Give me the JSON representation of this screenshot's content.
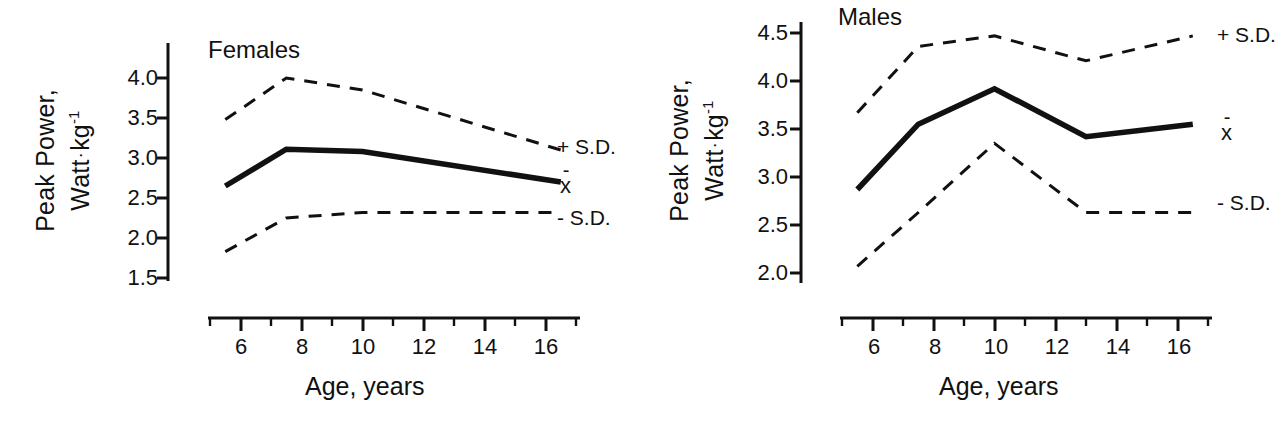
{
  "figure": {
    "width": 1282,
    "height": 423,
    "background": "#ffffff",
    "ink_color": "#111111"
  },
  "axis_titles": {
    "y_line1": "Peak Power,",
    "y_line2_main": "Watt",
    "y_line2_dot": "·",
    "y_line2_unit": "kg",
    "y_line2_exponent": "-1",
    "x": "Age,  years"
  },
  "panels": [
    {
      "id": "females",
      "title": "Females",
      "y_ticks": [
        "4.0",
        "3.5",
        "3.0",
        "2.5",
        "2.0",
        "1.5"
      ],
      "x_ticks": [
        "6",
        "8",
        "10",
        "12",
        "14",
        "16"
      ],
      "series_labels": {
        "upper": "+ S.D.",
        "mean": "x",
        "mean_overbar": "-",
        "lower": "- S.D."
      }
    },
    {
      "id": "males",
      "title": "Males",
      "y_ticks": [
        "4.5",
        "4.0",
        "3.5",
        "3.0",
        "2.5",
        "2.0"
      ],
      "x_ticks": [
        "6",
        "8",
        "10",
        "12",
        "14",
        "16"
      ],
      "series_labels": {
        "upper": "+ S.D.",
        "mean": "x",
        "mean_overbar": "-",
        "lower": "- S.D."
      }
    }
  ],
  "chart_data": [
    {
      "type": "line",
      "title": "Females",
      "xlabel": "Age, years",
      "ylabel": "Peak Power, Watt · kg^-1",
      "xlim": [
        5.0,
        17.0
      ],
      "ylim": [
        1.5,
        4.15
      ],
      "grid": false,
      "legend_position": "right-of-curves",
      "x_major_ticks": [
        6,
        8,
        10,
        12,
        14,
        16
      ],
      "x_minor_ticks": [
        5,
        7,
        9,
        11,
        13,
        15,
        17
      ],
      "y_ticks": [
        1.5,
        2.0,
        2.5,
        3.0,
        3.5,
        4.0
      ],
      "x": [
        5.5,
        7.5,
        10.0,
        16.5
      ],
      "series": [
        {
          "name": "+ S.D.",
          "style": "dashed",
          "values": [
            3.48,
            4.0,
            3.85,
            3.1
          ]
        },
        {
          "name": "x̄",
          "style": "solid",
          "values": [
            2.65,
            3.11,
            3.08,
            2.7
          ]
        },
        {
          "name": "- S.D.",
          "style": "dashed",
          "values": [
            1.83,
            2.25,
            2.32,
            2.32
          ]
        }
      ]
    },
    {
      "type": "line",
      "title": "Males",
      "xlabel": "Age, years",
      "ylabel": "Peak Power, Watt · kg^-1",
      "xlim": [
        5.0,
        17.0
      ],
      "ylim": [
        2.0,
        4.6
      ],
      "grid": false,
      "legend_position": "right-of-curves",
      "x_major_ticks": [
        6,
        8,
        10,
        12,
        14,
        16
      ],
      "x_minor_ticks": [
        5,
        7,
        9,
        11,
        13,
        15,
        17
      ],
      "y_ticks": [
        2.0,
        2.5,
        3.0,
        3.5,
        4.0,
        4.5
      ],
      "x": [
        5.5,
        7.5,
        10.0,
        13.0,
        16.5
      ],
      "series": [
        {
          "name": "+ S.D.",
          "style": "dashed",
          "values": [
            3.67,
            4.36,
            4.47,
            4.21,
            4.47
          ]
        },
        {
          "name": "x̄",
          "style": "solid",
          "values": [
            2.87,
            3.55,
            3.92,
            3.42,
            3.55
          ]
        },
        {
          "name": "- S.D.",
          "style": "dashed",
          "values": [
            2.07,
            2.63,
            3.35,
            2.63,
            2.63
          ]
        }
      ]
    }
  ]
}
